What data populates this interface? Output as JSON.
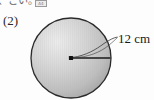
{
  "page": {
    "background_color": "#fdfdfd",
    "width": 154,
    "height": 100
  },
  "header": {
    "cropped_text": "、こい。",
    "badge_label": "A4"
  },
  "problem": {
    "number": "(2)"
  },
  "figure": {
    "shape_name": "circle",
    "center_dot": "center-point",
    "radius_label": "12 cm",
    "radius_value": "12",
    "radius_unit": "cm",
    "fill_light": "#e8e8e8",
    "fill_mid": "#c9c9c9",
    "fill_dark": "#a9a9a9",
    "stroke_color": "#2a2a2a",
    "leader_line": "curved-leader"
  }
}
